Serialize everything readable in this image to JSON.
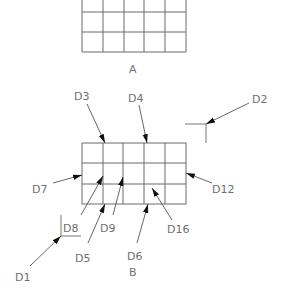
{
  "diagram": {
    "grids": [
      {
        "id": "A",
        "label": "A",
        "cols": 5,
        "rows": 3,
        "x": 82,
        "y": -8,
        "width": 104,
        "height": 60
      },
      {
        "id": "B",
        "label": "B",
        "cols": 5,
        "rows": 3,
        "x": 82,
        "y": 143,
        "width": 104,
        "height": 61
      }
    ],
    "callouts": [
      {
        "id": "D1",
        "label": "D1"
      },
      {
        "id": "D2",
        "label": "D2"
      },
      {
        "id": "D3",
        "label": "D3"
      },
      {
        "id": "D4",
        "label": "D4"
      },
      {
        "id": "D5",
        "label": "D5"
      },
      {
        "id": "D6",
        "label": "D6"
      },
      {
        "id": "D7",
        "label": "D7"
      },
      {
        "id": "D8",
        "label": "D8"
      },
      {
        "id": "D9",
        "label": "D9"
      },
      {
        "id": "D12",
        "label": "D12"
      },
      {
        "id": "D16",
        "label": "D16"
      }
    ],
    "colors": {
      "grid": "#6a6a6a",
      "text": "#707070",
      "arrowhead": "#111111"
    }
  }
}
